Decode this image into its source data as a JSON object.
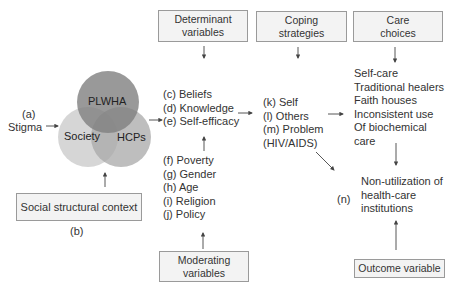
{
  "venn": {
    "circles": [
      {
        "label": "PLWHA",
        "color": "#8c8c8c"
      },
      {
        "label": "Society",
        "color": "#cfcfcf"
      },
      {
        "label": "HCPs",
        "color": "#b2b2b2"
      }
    ]
  },
  "stigma": {
    "marker": "(a)",
    "label": "Stigma"
  },
  "social_context": {
    "label": "Social structural context",
    "marker": "(b)"
  },
  "determinant_box": {
    "line1": "Determinant",
    "line2": "variables"
  },
  "determinants": [
    "(c) Beliefs",
    "(d) Knowledge",
    "(e) Self-efficacy"
  ],
  "moderators": [
    "(f)  Poverty",
    "(g) Gender",
    "(h) Age",
    "(i)   Religion",
    "(j)  Policy"
  ],
  "moderating_box": {
    "line1": "Moderating",
    "line2": "variables"
  },
  "coping_box": {
    "line1": "Coping",
    "line2": "strategies"
  },
  "coping": [
    "(k) Self",
    "(l) Others",
    "(m) Problem",
    "(HIV/AIDS)"
  ],
  "care_box": {
    "line1": "Care",
    "line2": "choices"
  },
  "care": [
    "Self-care",
    "Traditional healers",
    "Faith houses",
    "Inconsistent use",
    "Of biochemical",
    "care"
  ],
  "outcome": {
    "marker": "(n)",
    "lines": [
      "Non-utilization of",
      "health-care",
      "institutions"
    ]
  },
  "outcome_box": {
    "label": "Outcome variable"
  },
  "colors": {
    "box_border": "#9a9a9a",
    "box_fill": "#f3f3f3",
    "arrow": "#444444"
  }
}
